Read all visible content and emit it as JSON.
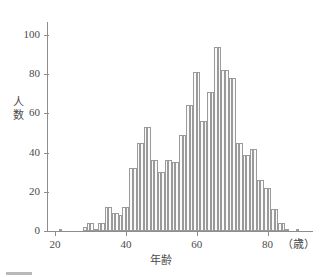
{
  "chart_data": {
    "type": "bar",
    "title": "",
    "subtitle": "",
    "xlabel": "年齢",
    "ylabel": "人数",
    "x_unit_label": "（歳）",
    "xlim": [
      18,
      92
    ],
    "ylim": [
      0,
      105
    ],
    "x_ticks": [
      20,
      40,
      60,
      80
    ],
    "y_ticks": [
      0,
      20,
      40,
      60,
      80,
      100
    ],
    "grid": false,
    "legend": null,
    "bin_width": 1,
    "bar_fill": "#fbfbfb",
    "bar_stroke": "#9a9a9a",
    "axis_color": "#8d8d8d",
    "text_color": "#4a4a4a",
    "categories": [
      21,
      22,
      28,
      29,
      30,
      31,
      32,
      33,
      34,
      35,
      36,
      37,
      38,
      39,
      40,
      41,
      42,
      43,
      44,
      45,
      46,
      47,
      48,
      49,
      50,
      51,
      52,
      53,
      54,
      55,
      56,
      57,
      58,
      59,
      60,
      61,
      62,
      63,
      64,
      65,
      66,
      67,
      68,
      69,
      70,
      71,
      72,
      73,
      74,
      75,
      76,
      77,
      78,
      79,
      80,
      81,
      82,
      83,
      84,
      85,
      86,
      87,
      88,
      90
    ],
    "values": [
      1,
      1,
      2,
      4,
      4,
      1,
      4,
      4,
      12,
      12,
      9,
      9,
      8,
      12,
      12,
      12,
      32,
      32,
      45,
      45,
      53,
      53,
      36,
      36,
      30,
      30,
      36,
      36,
      35,
      35,
      49,
      49,
      64,
      64,
      81,
      81,
      56,
      56,
      71,
      71,
      94,
      94,
      82,
      82,
      78,
      78,
      45,
      45,
      39,
      39,
      42,
      42,
      26,
      26,
      22,
      22,
      11,
      11,
      4,
      4,
      1,
      1,
      1,
      1
    ]
  },
  "bars": [
    {
      "age": 21,
      "count": 1
    },
    {
      "age": 28,
      "count": 2
    },
    {
      "age": 29,
      "count": 4
    },
    {
      "age": 30,
      "count": 4
    },
    {
      "age": 31,
      "count": 1
    },
    {
      "age": 32,
      "count": 4
    },
    {
      "age": 33,
      "count": 4
    },
    {
      "age": 34,
      "count": 12
    },
    {
      "age": 35,
      "count": 12
    },
    {
      "age": 36,
      "count": 9
    },
    {
      "age": 37,
      "count": 9
    },
    {
      "age": 38,
      "count": 8
    },
    {
      "age": 39,
      "count": 12
    },
    {
      "age": 40,
      "count": 12
    },
    {
      "age": 41,
      "count": 32
    },
    {
      "age": 42,
      "count": 32
    },
    {
      "age": 43,
      "count": 45
    },
    {
      "age": 44,
      "count": 45
    },
    {
      "age": 45,
      "count": 53
    },
    {
      "age": 46,
      "count": 53
    },
    {
      "age": 47,
      "count": 36
    },
    {
      "age": 48,
      "count": 36
    },
    {
      "age": 49,
      "count": 30
    },
    {
      "age": 50,
      "count": 30
    },
    {
      "age": 51,
      "count": 36
    },
    {
      "age": 52,
      "count": 36
    },
    {
      "age": 53,
      "count": 35
    },
    {
      "age": 54,
      "count": 35
    },
    {
      "age": 55,
      "count": 49
    },
    {
      "age": 56,
      "count": 49
    },
    {
      "age": 57,
      "count": 64
    },
    {
      "age": 58,
      "count": 64
    },
    {
      "age": 59,
      "count": 81
    },
    {
      "age": 60,
      "count": 81
    },
    {
      "age": 61,
      "count": 56
    },
    {
      "age": 62,
      "count": 56
    },
    {
      "age": 63,
      "count": 71
    },
    {
      "age": 64,
      "count": 71
    },
    {
      "age": 65,
      "count": 94
    },
    {
      "age": 66,
      "count": 94
    },
    {
      "age": 67,
      "count": 82
    },
    {
      "age": 68,
      "count": 82
    },
    {
      "age": 69,
      "count": 78
    },
    {
      "age": 70,
      "count": 78
    },
    {
      "age": 71,
      "count": 45
    },
    {
      "age": 72,
      "count": 45
    },
    {
      "age": 73,
      "count": 39
    },
    {
      "age": 74,
      "count": 39
    },
    {
      "age": 75,
      "count": 42
    },
    {
      "age": 76,
      "count": 42
    },
    {
      "age": 77,
      "count": 26
    },
    {
      "age": 78,
      "count": 26
    },
    {
      "age": 79,
      "count": 22
    },
    {
      "age": 80,
      "count": 22
    },
    {
      "age": 81,
      "count": 11
    },
    {
      "age": 82,
      "count": 11
    },
    {
      "age": 83,
      "count": 4
    },
    {
      "age": 84,
      "count": 4
    },
    {
      "age": 85,
      "count": 1
    },
    {
      "age": 88,
      "count": 1
    }
  ],
  "axis": {
    "y_tick_labels": [
      "100",
      "80",
      "60",
      "40",
      "20",
      "0"
    ],
    "x_tick_labels": [
      "20",
      "40",
      "60",
      "80"
    ],
    "y_title": "人数",
    "x_title": "年齢",
    "x_unit": "（歳）"
  }
}
